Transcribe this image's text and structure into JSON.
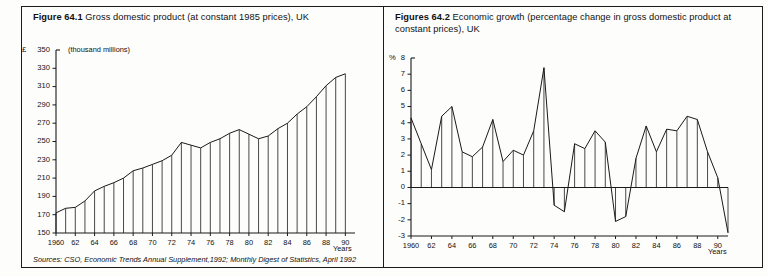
{
  "figure": {
    "left": {
      "number": "Figure 64.1",
      "title": "Gross domestic product (at constant 1985 prices), UK",
      "unit_note": "(thousand millions)",
      "y_axis_unit": "£",
      "x_axis_caption": "Years"
    },
    "right": {
      "number": "Figures 64.2",
      "title": "Economic growth (percentage change in gross domestic product at constant prices), UK",
      "y_axis_unit": "%",
      "x_axis_caption": "Years"
    },
    "sources_prefix": "Sources:",
    "sources": "CSO, Economic Trends Annual Supplement,1992; Monthly Digest of Statistics, April 1992"
  },
  "chart_data": [
    {
      "id": "gdp",
      "type": "line",
      "title": "Gross domestic product (at constant 1985 prices), UK",
      "xlabel": "Years",
      "ylabel": "£ (thousand millions)",
      "ylim": [
        150,
        350
      ],
      "ytick_step": 20,
      "yticks": [
        150,
        170,
        190,
        210,
        230,
        250,
        270,
        290,
        310,
        330,
        350
      ],
      "xlim": [
        1960,
        1991
      ],
      "xticks": [
        1960,
        1962,
        1964,
        1966,
        1968,
        1970,
        1972,
        1974,
        1976,
        1978,
        1980,
        1982,
        1984,
        1986,
        1988,
        1990
      ],
      "xticklabels": [
        "1960",
        "62",
        "64",
        "66",
        "68",
        "70",
        "72",
        "74",
        "76",
        "78",
        "80",
        "82",
        "84",
        "86",
        "88",
        "90"
      ],
      "grid": false,
      "legend": "none",
      "drop_lines": true,
      "x": [
        1960,
        1961,
        1962,
        1963,
        1964,
        1965,
        1966,
        1967,
        1968,
        1969,
        1970,
        1971,
        1972,
        1973,
        1974,
        1975,
        1976,
        1977,
        1978,
        1979,
        1980,
        1981,
        1982,
        1983,
        1984,
        1985,
        1986,
        1987,
        1988,
        1989,
        1990
      ],
      "values": [
        172,
        177,
        178,
        185,
        196,
        201,
        205,
        210,
        218,
        221,
        225,
        229,
        235,
        249,
        246,
        243,
        249,
        253,
        259,
        263,
        258,
        253,
        256,
        264,
        270,
        280,
        288,
        299,
        311,
        320,
        324
      ]
    },
    {
      "id": "growth",
      "type": "line",
      "title": "Economic growth (percentage change in gross domestic product at constant prices), UK",
      "xlabel": "Years",
      "ylabel": "%",
      "ylim": [
        -3,
        8
      ],
      "ytick_step": 1,
      "yticks": [
        -3,
        -2,
        -1,
        0,
        1,
        2,
        3,
        4,
        5,
        6,
        7,
        8
      ],
      "xlim": [
        1960,
        1991
      ],
      "xticks": [
        1960,
        1962,
        1964,
        1966,
        1968,
        1970,
        1972,
        1974,
        1976,
        1978,
        1980,
        1982,
        1984,
        1986,
        1988,
        1990
      ],
      "xticklabels": [
        "1960",
        "62",
        "64",
        "66",
        "68",
        "70",
        "72",
        "74",
        "76",
        "78",
        "80",
        "82",
        "84",
        "86",
        "88",
        "90"
      ],
      "grid": false,
      "legend": "none",
      "drop_lines": true,
      "zero_line": true,
      "x": [
        1960,
        1961,
        1962,
        1963,
        1964,
        1965,
        1966,
        1967,
        1968,
        1969,
        1970,
        1971,
        1972,
        1973,
        1974,
        1975,
        1976,
        1977,
        1978,
        1979,
        1980,
        1981,
        1982,
        1983,
        1984,
        1985,
        1986,
        1987,
        1988,
        1989,
        1990,
        1991
      ],
      "values": [
        4.3,
        2.7,
        1.1,
        4.4,
        5.0,
        2.2,
        1.9,
        2.5,
        4.2,
        1.6,
        2.3,
        2.0,
        3.5,
        7.4,
        -1.1,
        -1.5,
        2.7,
        2.4,
        3.5,
        2.8,
        -2.1,
        -1.8,
        1.8,
        3.8,
        2.2,
        3.6,
        3.5,
        4.4,
        4.2,
        2.2,
        0.6,
        -2.8
      ]
    }
  ]
}
